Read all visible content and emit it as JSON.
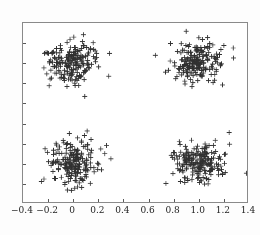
{
  "chart_data": {
    "type": "scatter",
    "title": "",
    "subtitle": "",
    "xlabel": "",
    "ylabel": "",
    "xlim": [
      -0.4,
      1.4
    ],
    "ylim": [
      -0.4,
      1.4
    ],
    "grid": false,
    "legend": null,
    "marker": "+",
    "marker_color": "#303030",
    "marker_size_px": 5,
    "xticks": [
      -0.4,
      -0.2,
      0,
      0.2,
      0.4,
      0.6,
      0.8,
      1.0,
      1.2,
      1.4
    ],
    "xticklabels": [
      "−0.4",
      "−0.2",
      "0",
      "0.2",
      "0.4",
      "0.6",
      "0.8",
      "1.0",
      "1.2",
      "1.4"
    ],
    "yticks": [
      -0.4,
      -0.2,
      0,
      0.2,
      0.4,
      0.6,
      0.8,
      1.0,
      1.2,
      1.4
    ],
    "yticklabels": [
      "−0.4",
      "−0.2",
      "0",
      "0.2",
      "0.4",
      "0.6",
      "0.8",
      "1.0",
      "1.2",
      "1.4"
    ],
    "clusters": [
      {
        "name": "cluster-bottom-left",
        "center": [
          0.0,
          0.0
        ],
        "std": 0.105,
        "n": 200
      },
      {
        "name": "cluster-top-left",
        "center": [
          0.0,
          1.0
        ],
        "std": 0.105,
        "n": 200
      },
      {
        "name": "cluster-bottom-right",
        "center": [
          1.0,
          0.0
        ],
        "std": 0.105,
        "n": 200
      },
      {
        "name": "cluster-top-right",
        "center": [
          1.0,
          1.0
        ],
        "std": 0.105,
        "n": 200
      }
    ],
    "series": [
      {
        "name": "points",
        "marker": "+",
        "color": "#303030",
        "x": [],
        "y": []
      }
    ]
  }
}
